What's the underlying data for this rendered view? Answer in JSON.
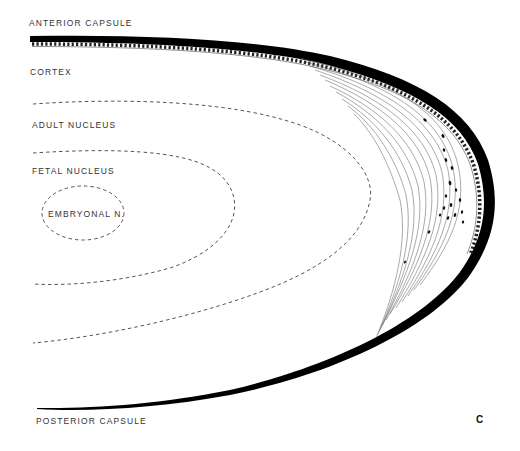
{
  "figure": {
    "panel_letter": "C",
    "labels": {
      "anterior_capsule": "ANTERIOR CAPSULE",
      "cortex": "CORTEX",
      "adult_nucleus": "ADULT NUCLEUS",
      "fetal_nucleus": "FETAL NUCLEUS",
      "embryonal_nucleus": "EMBRYONAL N.",
      "posterior_capsule": "POSTERIOR CAPSULE"
    },
    "colors": {
      "capsule": "#000000",
      "dashed_boundary": "#555555",
      "fiber_lines": "#555555",
      "text": "#333333",
      "background": "#ffffff"
    }
  }
}
